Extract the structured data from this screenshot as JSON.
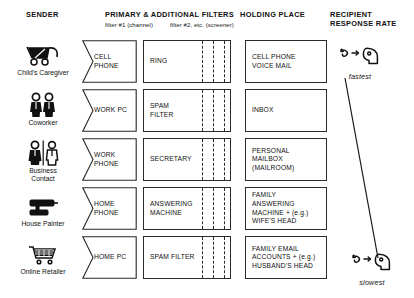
{
  "headers": {
    "sender": "SENDER",
    "filters": "PRIMARY & ADDITIONAL FILTERS",
    "filter1_sub": "filter #1 (channel)",
    "filter2_sub": "filter #2, etc. (screener)",
    "holding": "HOLDING PLACE",
    "response_line1": "RECIPIENT",
    "response_line2": "RESPONSE RATE"
  },
  "rows": [
    {
      "sender": "Child's Caregiver",
      "sender_icon": "stroller-icon",
      "filter1": "CELL\nPHONE",
      "filter2": "RING",
      "holding": "CELL PHONE\nVOICE MAIL"
    },
    {
      "sender": "Coworker",
      "sender_icon": "two-people-icon",
      "filter1": "WORK PC",
      "filter2": "SPAM\nFILTER",
      "holding": "INBOX"
    },
    {
      "sender": "Business\nContact",
      "sender_icon": "business-contact-icon",
      "filter1": "WORK\nPHONE",
      "filter2": "SECRETARY",
      "holding": "PERSONAL\nMAILBOX\n(MAILROOM)"
    },
    {
      "sender": "House Painter",
      "sender_icon": "paint-roller-icon",
      "filter1": "HOME\nPHONE",
      "filter2": "ANSWERING\nMACHINE",
      "holding": "FAMILY\nANSWERING\nMACHINE + (e.g.)\nWIFE'S HEAD"
    },
    {
      "sender": "Online Retailer",
      "sender_icon": "shopping-cart-icon",
      "filter1": "HOME PC",
      "filter2": "SPAM FILTER",
      "holding": "FAMILY EMAIL\nACCOUNTS +  (e.g.)\nHUSBAND'S HEAD"
    }
  ],
  "response": {
    "fastest": "fastest",
    "slowest": "slowest",
    "icon": "head-with-arrow-icon"
  },
  "colors": {
    "stroke": "#2a2a2a",
    "text": "#111111",
    "background": "#ffffff"
  }
}
